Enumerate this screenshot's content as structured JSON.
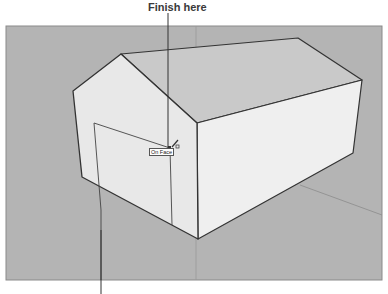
{
  "figure": {
    "callout_top": "Finish here",
    "callout_bottom": ""
  },
  "viewport": {
    "background_color": "#b4b4b4",
    "tool": "pencil-line-tool",
    "inference_tooltip": "On Face"
  },
  "model": {
    "object": "house",
    "faces": [
      "front-gable-wall",
      "roof",
      "right-side-wall",
      "door-outline"
    ],
    "colors": {
      "wall_front": "#e9e9e9",
      "wall_side": "#eeeeee",
      "roof": "#c9c9c9",
      "edge": "#333333",
      "axis": "#8c8c8c"
    }
  }
}
